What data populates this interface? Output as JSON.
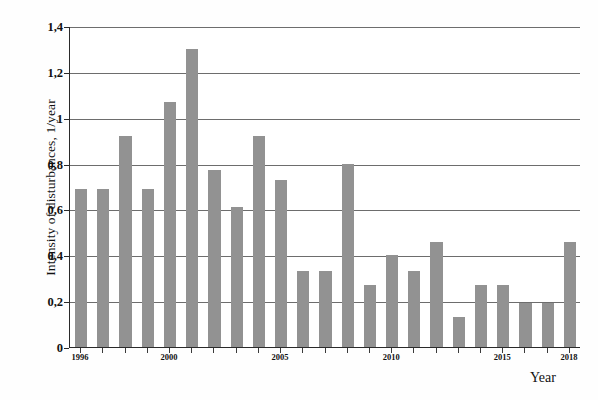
{
  "chart_data": {
    "type": "bar",
    "title": "",
    "xlabel": "Year",
    "ylabel": "Intensity of disturbances, 1/year",
    "ylim": [
      0,
      1.4
    ],
    "xlim": [
      1995.5,
      2018.5
    ],
    "grid": true,
    "legend": false,
    "bar_color": "#929292",
    "decimal_separator": ",",
    "y_ticks": [
      0,
      0.2,
      0.4,
      0.6,
      0.8,
      1.0,
      1.2,
      1.4
    ],
    "y_tick_labels": [
      "0",
      "0,2",
      "0,4",
      "0,6",
      "0,8",
      "1",
      "1,2",
      "1,4"
    ],
    "x_tick_years": [
      1996,
      2000,
      2005,
      2010,
      2015,
      2018
    ],
    "x_tick_labels": [
      "1996",
      "2000",
      "2005",
      "2010",
      "2015",
      "2018"
    ],
    "categories": [
      "1996",
      "1997",
      "1998",
      "1999",
      "2000",
      "2001",
      "2002",
      "2003",
      "2004",
      "2005",
      "2006",
      "2007",
      "2008",
      "2009",
      "2010",
      "2011",
      "2012",
      "2013",
      "2014",
      "2015",
      "2016",
      "2017",
      "2018"
    ],
    "values": [
      0.69,
      0.69,
      0.92,
      0.69,
      1.07,
      1.3,
      0.77,
      0.61,
      0.92,
      0.73,
      0.33,
      0.33,
      0.8,
      0.27,
      0.4,
      0.33,
      0.46,
      0.13,
      0.27,
      0.27,
      0.19,
      0.19,
      0.46
    ]
  }
}
